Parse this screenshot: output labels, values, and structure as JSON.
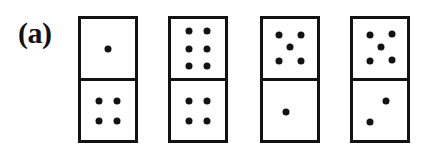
{
  "figure": {
    "panel_label": "(a)",
    "background_color": "#ffffff",
    "ink_color": "#121212",
    "width": 426,
    "height": 152
  },
  "style": {
    "border_width_px": 3,
    "divider_width_px": 3,
    "pip_diameter_px": 7,
    "domino_width_px": 60,
    "domino_height_px": 127
  },
  "dominoes": [
    {
      "name": "domino-1",
      "notation": "1|4",
      "x": 78,
      "y": 16,
      "width": 60,
      "height": 127,
      "top": {
        "value": 1,
        "pips": [
          {
            "cx": 50,
            "cy": 50
          }
        ]
      },
      "bottom": {
        "value": 4,
        "pips": [
          {
            "cx": 33,
            "cy": 34
          },
          {
            "cx": 67,
            "cy": 34
          },
          {
            "cx": 33,
            "cy": 68
          },
          {
            "cx": 67,
            "cy": 68
          }
        ]
      }
    },
    {
      "name": "domino-2",
      "notation": "6|4",
      "x": 168,
      "y": 16,
      "width": 60,
      "height": 127,
      "top": {
        "value": 6,
        "pips": [
          {
            "cx": 33,
            "cy": 20
          },
          {
            "cx": 67,
            "cy": 20
          },
          {
            "cx": 33,
            "cy": 50
          },
          {
            "cx": 67,
            "cy": 50
          },
          {
            "cx": 33,
            "cy": 80
          },
          {
            "cx": 67,
            "cy": 80
          }
        ]
      },
      "bottom": {
        "value": 4,
        "pips": [
          {
            "cx": 33,
            "cy": 34
          },
          {
            "cx": 67,
            "cy": 34
          },
          {
            "cx": 33,
            "cy": 68
          },
          {
            "cx": 67,
            "cy": 68
          }
        ]
      }
    },
    {
      "name": "domino-3",
      "notation": "5|1",
      "x": 260,
      "y": 16,
      "width": 60,
      "height": 127,
      "top": {
        "value": 5,
        "pips": [
          {
            "cx": 30,
            "cy": 27
          },
          {
            "cx": 70,
            "cy": 27
          },
          {
            "cx": 50,
            "cy": 48
          },
          {
            "cx": 30,
            "cy": 72
          },
          {
            "cx": 70,
            "cy": 72
          }
        ]
      },
      "bottom": {
        "value": 1,
        "pips": [
          {
            "cx": 42,
            "cy": 52
          }
        ]
      }
    },
    {
      "name": "domino-4",
      "notation": "5|2",
      "x": 350,
      "y": 16,
      "width": 60,
      "height": 127,
      "top": {
        "value": 5,
        "pips": [
          {
            "cx": 32,
            "cy": 27
          },
          {
            "cx": 72,
            "cy": 25
          },
          {
            "cx": 52,
            "cy": 48
          },
          {
            "cx": 32,
            "cy": 72
          },
          {
            "cx": 72,
            "cy": 70
          }
        ]
      },
      "bottom": {
        "value": 2,
        "pips": [
          {
            "cx": 62,
            "cy": 34
          },
          {
            "cx": 32,
            "cy": 70
          }
        ]
      }
    }
  ]
}
